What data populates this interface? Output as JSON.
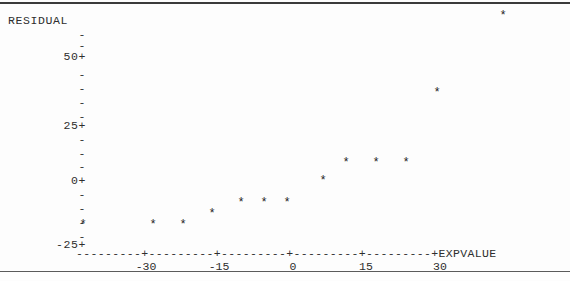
{
  "plot": {
    "type": "character-scatter",
    "y_axis_title": "RESIDUAL",
    "x_axis_title": "EXPVALUE",
    "axis_line": "---------+---------+---------+---------+---------+",
    "y_tick_labels": [
      "50+",
      "25+",
      "0+",
      "-25+"
    ],
    "y_minor_tick": "-",
    "x_tick_labels": [
      "-30",
      "-15",
      "0",
      "15",
      "30"
    ],
    "point_glyph": "*"
  },
  "chart_data": {
    "type": "scatter",
    "title": "",
    "xlabel": "EXPVALUE",
    "ylabel": "RESIDUAL",
    "xlim": [
      -39,
      46
    ],
    "ylim": [
      -25,
      62
    ],
    "xticks": [
      -30,
      -15,
      0,
      15,
      30
    ],
    "yticks": [
      -25,
      0,
      25,
      50
    ],
    "grid": false,
    "legend": null,
    "x": [
      -36,
      -21,
      -15,
      -9,
      -3,
      1,
      5,
      10,
      16,
      23,
      28,
      35,
      51
    ],
    "y": [
      -24,
      -24,
      -24,
      -19,
      -16,
      -16,
      -16,
      -9,
      -2,
      -2,
      -2,
      21,
      52
    ],
    "points": [
      {
        "x": -36,
        "y": -24
      },
      {
        "x": -21,
        "y": -24
      },
      {
        "x": -15,
        "y": -24
      },
      {
        "x": -9,
        "y": -19
      },
      {
        "x": -3,
        "y": -16
      },
      {
        "x": 1,
        "y": -16
      },
      {
        "x": 5,
        "y": -16
      },
      {
        "x": 10,
        "y": -9
      },
      {
        "x": 16,
        "y": -2
      },
      {
        "x": 23,
        "y": -2
      },
      {
        "x": 28,
        "y": -2
      },
      {
        "x": 35,
        "y": 21
      },
      {
        "x": 51,
        "y": 52
      }
    ]
  },
  "geometry": {
    "y_ticks_px": [
      {
        "label": "50+",
        "top": 46
      },
      {
        "label": "25+",
        "top": 115
      },
      {
        "label": "0+",
        "top": 170
      },
      {
        "label": "-25+",
        "top": 234
      }
    ],
    "y_minor_px": [
      24,
      35,
      64,
      78,
      92,
      106,
      129,
      143,
      156,
      184,
      198,
      212,
      226
    ],
    "x_ticks_px": [
      {
        "label": "-30",
        "left": 146
      },
      {
        "label": "-15",
        "left": 219
      },
      {
        "label": "0",
        "left": 293
      },
      {
        "label": "15",
        "left": 366
      },
      {
        "label": "30",
        "left": 440
      }
    ],
    "points_px": [
      {
        "left": 83,
        "top": 221
      },
      {
        "left": 153,
        "top": 221
      },
      {
        "left": 183,
        "top": 221
      },
      {
        "left": 212,
        "top": 210
      },
      {
        "left": 241,
        "top": 199
      },
      {
        "left": 264,
        "top": 199
      },
      {
        "left": 287,
        "top": 199
      },
      {
        "left": 323,
        "top": 177
      },
      {
        "left": 346,
        "top": 159
      },
      {
        "left": 376,
        "top": 159
      },
      {
        "left": 406,
        "top": 159
      },
      {
        "left": 437,
        "top": 89
      },
      {
        "left": 503,
        "top": 12
      }
    ]
  }
}
